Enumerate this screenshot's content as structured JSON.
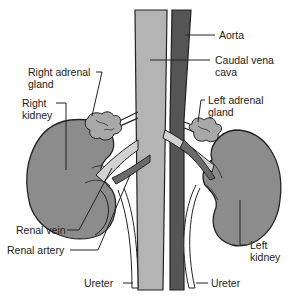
{
  "diagram": {
    "colors": {
      "vena_cava": "#b4b4b4",
      "aorta": "#555555",
      "kidney": "#8c8c8c",
      "adrenal": "#a8a8a8",
      "renal_vein": "#d2d2d2",
      "renal_artery": "#6a6a6a",
      "outline": "#222222",
      "background": "#ffffff"
    },
    "labels": {
      "aorta": "Aorta",
      "caudal_vena_cava_1": "Caudal vena",
      "caudal_vena_cava_2": "cava",
      "left_adrenal_1": "Left adrenal",
      "left_adrenal_2": "gland",
      "right_adrenal_1": "Right adrenal",
      "right_adrenal_2": "gland",
      "right_kidney_1": "Right",
      "right_kidney_2": "kidney",
      "left_kidney_1": "Left",
      "left_kidney_2": "kidney",
      "renal_vein": "Renal vein",
      "renal_artery": "Renal artery",
      "ureter_left_side": "Ureter",
      "ureter_right_side": "Ureter"
    }
  }
}
